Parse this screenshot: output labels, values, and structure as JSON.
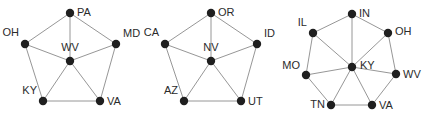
{
  "figure": {
    "title": "",
    "background_color": "#ffffff",
    "node_color": "#1f1f1f",
    "edge_color": "#8a8a8a",
    "label_color": "#2b2b2b",
    "node_radius": 4.2,
    "edge_width": 0.9
  },
  "chart_data": {
    "type": "diagram",
    "title": "",
    "subtitle": "",
    "xlabel": "",
    "ylabel": "",
    "grid": false,
    "legend": null,
    "graphs": [
      {
        "id": "graph-1",
        "name": "wv-wheel",
        "hub": "WV",
        "node_count": 6,
        "edge_count": 10,
        "nodes": [
          {
            "id": "PA",
            "label": "PA",
            "x": 70,
            "y": 13,
            "label_dx": 7,
            "label_dy": 0,
            "anchor": "start"
          },
          {
            "id": "OH",
            "label": "OH",
            "x": 25,
            "y": 44,
            "label_dx": -6,
            "label_dy": -11,
            "anchor": "end"
          },
          {
            "id": "MD",
            "label": "MD",
            "x": 116,
            "y": 44,
            "label_dx": 7,
            "label_dy": -10,
            "anchor": "start"
          },
          {
            "id": "WV",
            "label": "WV",
            "x": 70,
            "y": 61,
            "label_dx": 0,
            "label_dy": -13,
            "anchor": "middle"
          },
          {
            "id": "KY",
            "label": "KY",
            "x": 43,
            "y": 101,
            "label_dx": -6,
            "label_dy": -10,
            "anchor": "end"
          },
          {
            "id": "VA",
            "label": "VA",
            "x": 100,
            "y": 101,
            "label_dx": 7,
            "label_dy": 1,
            "anchor": "start"
          }
        ],
        "edges": [
          [
            "OH",
            "PA"
          ],
          [
            "PA",
            "MD"
          ],
          [
            "OH",
            "WV"
          ],
          [
            "PA",
            "WV"
          ],
          [
            "MD",
            "WV"
          ],
          [
            "OH",
            "KY"
          ],
          [
            "KY",
            "WV"
          ],
          [
            "WV",
            "VA"
          ],
          [
            "MD",
            "VA"
          ],
          [
            "KY",
            "VA"
          ]
        ]
      },
      {
        "id": "graph-2",
        "name": "nv-wheel",
        "hub": "NV",
        "node_count": 6,
        "edge_count": 10,
        "nodes": [
          {
            "id": "OR",
            "label": "OR",
            "x": 211,
            "y": 13,
            "label_dx": 7,
            "label_dy": 0,
            "anchor": "start"
          },
          {
            "id": "CA",
            "label": "CA",
            "x": 165,
            "y": 44,
            "label_dx": -6,
            "label_dy": -11,
            "anchor": "end"
          },
          {
            "id": "ID",
            "label": "ID",
            "x": 257,
            "y": 44,
            "label_dx": 7,
            "label_dy": -10,
            "anchor": "start"
          },
          {
            "id": "NV",
            "label": "NV",
            "x": 211,
            "y": 61,
            "label_dx": 0,
            "label_dy": -13,
            "anchor": "middle"
          },
          {
            "id": "AZ",
            "label": "AZ",
            "x": 184,
            "y": 101,
            "label_dx": -6,
            "label_dy": -10,
            "anchor": "end"
          },
          {
            "id": "UT",
            "label": "UT",
            "x": 241,
            "y": 101,
            "label_dx": 7,
            "label_dy": 1,
            "anchor": "start"
          }
        ],
        "edges": [
          [
            "CA",
            "OR"
          ],
          [
            "OR",
            "ID"
          ],
          [
            "CA",
            "NV"
          ],
          [
            "OR",
            "NV"
          ],
          [
            "ID",
            "NV"
          ],
          [
            "CA",
            "AZ"
          ],
          [
            "AZ",
            "NV"
          ],
          [
            "NV",
            "UT"
          ],
          [
            "ID",
            "UT"
          ],
          [
            "AZ",
            "UT"
          ]
        ]
      },
      {
        "id": "graph-3",
        "name": "ky-wheel",
        "hub": "KY",
        "node_count": 8,
        "edge_count": 14,
        "nodes": [
          {
            "id": "IN",
            "label": "IN",
            "x": 352,
            "y": 14,
            "label_dx": 7,
            "label_dy": 0,
            "anchor": "start"
          },
          {
            "id": "IL",
            "label": "IL",
            "x": 313,
            "y": 33,
            "label_dx": -6,
            "label_dy": -10,
            "anchor": "end"
          },
          {
            "id": "OH",
            "label": "OH",
            "x": 388,
            "y": 33,
            "label_dx": 7,
            "label_dy": -1,
            "anchor": "start"
          },
          {
            "id": "MO",
            "label": "MO",
            "x": 306,
            "y": 75,
            "label_dx": -6,
            "label_dy": -9,
            "anchor": "end"
          },
          {
            "id": "KY",
            "label": "KY",
            "x": 352,
            "y": 67,
            "label_dx": 8,
            "label_dy": -1,
            "anchor": "start"
          },
          {
            "id": "WV",
            "label": "WV",
            "x": 396,
            "y": 74,
            "label_dx": 7,
            "label_dy": 1,
            "anchor": "start"
          },
          {
            "id": "TN",
            "label": "TN",
            "x": 331,
            "y": 105,
            "label_dx": -6,
            "label_dy": 0,
            "anchor": "end"
          },
          {
            "id": "VA",
            "label": "VA",
            "x": 372,
            "y": 105,
            "label_dx": 7,
            "label_dy": 1,
            "anchor": "start"
          }
        ],
        "edges": [
          [
            "IL",
            "IN"
          ],
          [
            "IN",
            "OH"
          ],
          [
            "IL",
            "MO"
          ],
          [
            "OH",
            "WV"
          ],
          [
            "MO",
            "TN"
          ],
          [
            "TN",
            "VA"
          ],
          [
            "VA",
            "WV"
          ],
          [
            "KY",
            "IL"
          ],
          [
            "KY",
            "IN"
          ],
          [
            "KY",
            "OH"
          ],
          [
            "KY",
            "MO"
          ],
          [
            "KY",
            "WV"
          ],
          [
            "KY",
            "TN"
          ],
          [
            "KY",
            "VA"
          ]
        ]
      }
    ]
  }
}
